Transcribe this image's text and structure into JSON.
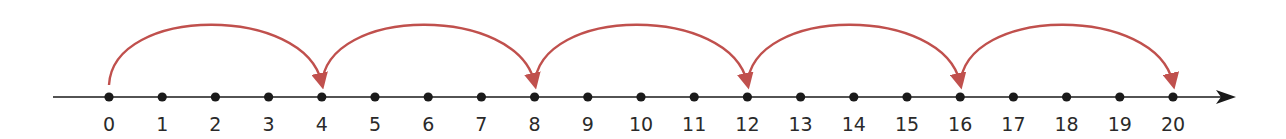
{
  "diagram": {
    "type": "number-line-jumps",
    "axis": {
      "start": 0,
      "end": 20,
      "step": 1,
      "color": "#1a1a1a"
    },
    "tick_labels": [
      "0",
      "1",
      "2",
      "3",
      "4",
      "5",
      "6",
      "7",
      "8",
      "9",
      "10",
      "11",
      "12",
      "13",
      "14",
      "15",
      "16",
      "17",
      "18",
      "19",
      "20"
    ],
    "jumps": [
      {
        "from": 0,
        "to": 4
      },
      {
        "from": 4,
        "to": 8
      },
      {
        "from": 8,
        "to": 12
      },
      {
        "from": 12,
        "to": 16
      },
      {
        "from": 16,
        "to": 20
      }
    ],
    "jump_size": 4,
    "arc_color": "#c0504d"
  }
}
